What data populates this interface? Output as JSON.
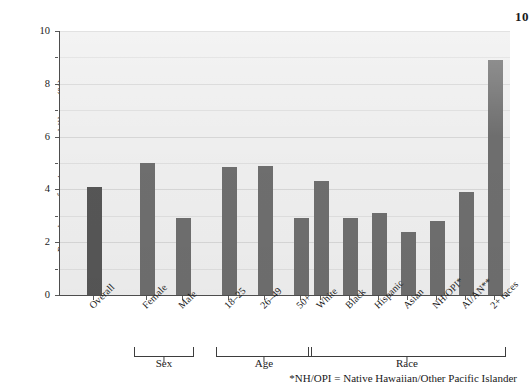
{
  "corner": {
    "page_number": "10"
  },
  "footnote": {
    "text": "*NH/OPI = Native Hawaiian/Other Pacific Islander"
  },
  "axis": {
    "ylabel": "Prevalence of serious mental illness (%)",
    "yticks": [
      "0",
      "2",
      "4",
      "6",
      "8",
      "10"
    ]
  },
  "groups": [
    {
      "name": "Sex"
    },
    {
      "name": "Age"
    },
    {
      "name": "Race"
    }
  ],
  "chart_data": {
    "type": "bar",
    "title": "",
    "xlabel": "",
    "ylabel": "Prevalence of serious mental illness (%)",
    "ylim": [
      0,
      10
    ],
    "ytick_values": [
      0,
      2,
      4,
      6,
      8,
      10
    ],
    "grid": true,
    "legend": "none",
    "categories": [
      "Overall",
      "Female",
      "Male",
      "18–25",
      "26–49",
      "50+",
      "White",
      "Black",
      "Hispanic",
      "Asian",
      "NH/OPI*",
      "AI/AN**",
      "2+ races"
    ],
    "values": [
      4.1,
      5.0,
      2.9,
      4.85,
      4.9,
      2.9,
      4.3,
      2.9,
      3.1,
      2.4,
      2.8,
      3.9,
      8.9
    ],
    "groups": [
      {
        "name": "Sex",
        "members": [
          "Female",
          "Male"
        ]
      },
      {
        "name": "Age",
        "members": [
          "18–25",
          "26–49",
          "50+"
        ]
      },
      {
        "name": "Race",
        "members": [
          "White",
          "Black",
          "Hispanic",
          "Asian",
          "NH/OPI*",
          "AI/AN**",
          "2+ races"
        ]
      }
    ],
    "annotations": [
      "*NH/OPI = Native Hawaiian/Other Pacific Islander"
    ],
    "colors": {
      "bar": "#6e6e6e",
      "bar_overall": "#565656",
      "plot_background": "#eeeeee"
    }
  }
}
